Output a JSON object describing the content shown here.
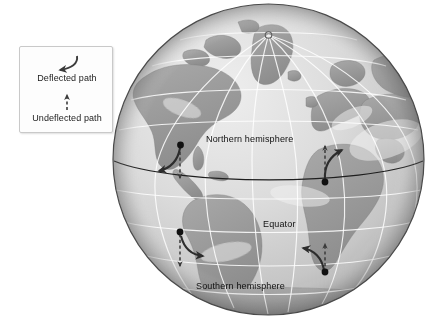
{
  "figure": {
    "type": "coriolis-deflection-globe-diagram",
    "background_color": "#ffffff"
  },
  "legend": {
    "name": "path-legend",
    "border_color": "#c9c9c9",
    "items": [
      {
        "icon": "curved-arrow-icon",
        "label": "Deflected path",
        "style": "solid-curved-arrow",
        "color": "#3b3b3b"
      },
      {
        "icon": "dashed-straight-arrow-icon",
        "label": "Undeflected path",
        "style": "dashed-straight-arrow",
        "color": "#3b3b3b"
      }
    ]
  },
  "globe": {
    "name": "earth-globe",
    "projection": "orthographic",
    "center_longitude": "-40",
    "ocean_color": "#d8d8d8",
    "land_color": "#9e9e9e",
    "graticule_color": "#ffffff",
    "outline_color": "#4a4a4a",
    "north_pole_marker": "open-circle",
    "equator_line_color": "#1e1e1e",
    "labels": [
      {
        "name": "northern-hemisphere-label",
        "text": "Northern hemisphere"
      },
      {
        "name": "equator-label",
        "text": "Equator"
      },
      {
        "name": "southern-hemisphere-label",
        "text": "Southern hemisphere"
      }
    ]
  },
  "deflection_arrows": [
    {
      "name": "nh-northward-arrow-pair",
      "hemisphere": "Northern hemisphere",
      "initial_direction": "north",
      "deflection": "right",
      "origin_marker": "filled-dot"
    },
    {
      "name": "nh-southward-arrow-pair",
      "hemisphere": "Northern hemisphere",
      "initial_direction": "south",
      "deflection": "right",
      "origin_marker": "filled-dot"
    },
    {
      "name": "sh-northward-arrow-pair",
      "hemisphere": "Southern hemisphere",
      "initial_direction": "north",
      "deflection": "left",
      "origin_marker": "filled-dot"
    },
    {
      "name": "sh-southward-arrow-pair",
      "hemisphere": "Southern hemisphere",
      "initial_direction": "south",
      "deflection": "left",
      "origin_marker": "filled-dot"
    }
  ]
}
